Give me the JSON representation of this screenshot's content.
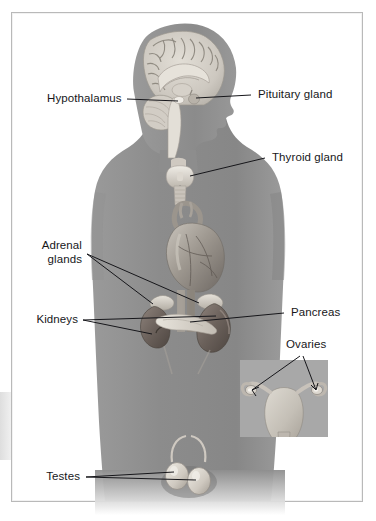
{
  "figure": {
    "background_color": "#ffffff",
    "frame_color": "#b9b9b9",
    "body_color": "#8e8e8e",
    "organ_light_color": "#d8d5cf",
    "organ_dark_color": "#5f5a56",
    "leader_line_color": "#1a1a1a"
  },
  "labels": {
    "hypothalamus": "Hypothalamus",
    "pituitary_gland": "Pituitary gland",
    "thyroid_gland": "Thyroid gland",
    "adrenal_glands_line1": "Adrenal",
    "adrenal_glands_line2": "glands",
    "kidneys": "Kidneys",
    "pancreas": "Pancreas",
    "ovaries": "Ovaries",
    "testes": "Testes"
  },
  "inset": {
    "name": "uterus-ovaries-inset",
    "background_color": "#a8a8a8",
    "bounds": {
      "x": 240,
      "y": 360,
      "width": 88,
      "height": 77
    }
  },
  "structures": [
    {
      "name": "brain",
      "region": "head"
    },
    {
      "name": "hypothalamus",
      "region": "head"
    },
    {
      "name": "pituitary-gland",
      "region": "head"
    },
    {
      "name": "cerebellum",
      "region": "head"
    },
    {
      "name": "brainstem",
      "region": "head"
    },
    {
      "name": "thyroid-gland",
      "region": "neck"
    },
    {
      "name": "trachea",
      "region": "neck"
    },
    {
      "name": "heart",
      "region": "thorax"
    },
    {
      "name": "aorta",
      "region": "thorax"
    },
    {
      "name": "adrenal-gland-left",
      "region": "abdomen"
    },
    {
      "name": "adrenal-gland-right",
      "region": "abdomen"
    },
    {
      "name": "kidney-left",
      "region": "abdomen"
    },
    {
      "name": "kidney-right",
      "region": "abdomen"
    },
    {
      "name": "pancreas",
      "region": "abdomen"
    },
    {
      "name": "testis-left",
      "region": "pelvis"
    },
    {
      "name": "testis-right",
      "region": "pelvis"
    },
    {
      "name": "uterus",
      "region": "inset"
    },
    {
      "name": "fallopian-tube-left",
      "region": "inset"
    },
    {
      "name": "fallopian-tube-right",
      "region": "inset"
    },
    {
      "name": "ovary-left",
      "region": "inset"
    },
    {
      "name": "ovary-right",
      "region": "inset"
    }
  ]
}
